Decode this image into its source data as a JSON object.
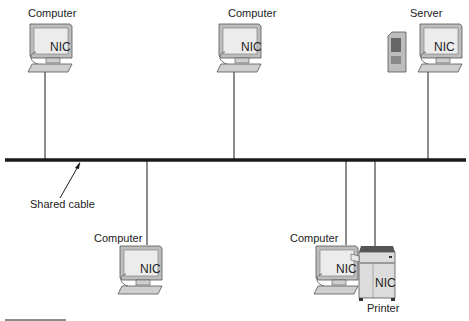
{
  "diagram": {
    "type": "bus-topology",
    "bus_label": "Shared cable",
    "nic_label": "NIC",
    "nodes": [
      {
        "id": "top-left",
        "label": "Computer",
        "kind": "computer"
      },
      {
        "id": "top-middle",
        "label": "Computer",
        "kind": "computer"
      },
      {
        "id": "top-right",
        "label": "Server",
        "kind": "server"
      },
      {
        "id": "bottom-left",
        "label": "Computer",
        "kind": "computer"
      },
      {
        "id": "bottom-middle",
        "label": "Computer",
        "kind": "computer"
      },
      {
        "id": "bottom-right",
        "label": "Printer",
        "kind": "printer"
      }
    ],
    "colors": {
      "cable": "#1a1a1a",
      "device": "#d9d9d9",
      "device_edge": "#555555",
      "screen": "#eeeeee"
    }
  }
}
